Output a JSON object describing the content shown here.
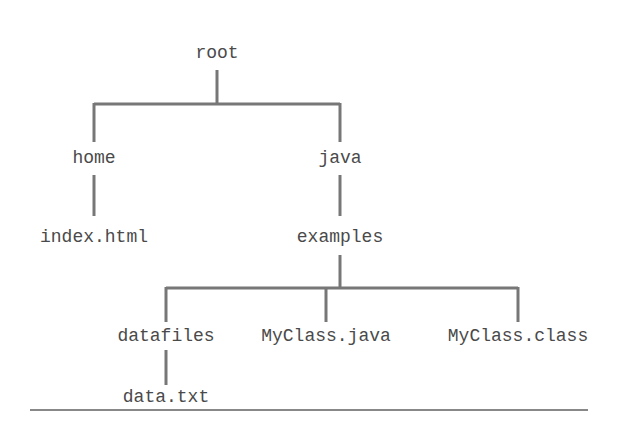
{
  "diagram": {
    "type": "directory-tree",
    "line_color": "#777777",
    "text_color": "#4a4a4a",
    "nodes": {
      "root": {
        "label": "root"
      },
      "home": {
        "label": "home"
      },
      "index_html": {
        "label": "index.html"
      },
      "java": {
        "label": "java"
      },
      "examples": {
        "label": "examples"
      },
      "datafiles": {
        "label": "datafiles"
      },
      "data_txt": {
        "label": "data.txt"
      },
      "myclass_java": {
        "label": "MyClass.java"
      },
      "myclass_class": {
        "label": "MyClass.class"
      }
    },
    "edges": [
      [
        "root",
        "home"
      ],
      [
        "root",
        "java"
      ],
      [
        "home",
        "index_html"
      ],
      [
        "java",
        "examples"
      ],
      [
        "examples",
        "datafiles"
      ],
      [
        "examples",
        "myclass_java"
      ],
      [
        "examples",
        "myclass_class"
      ],
      [
        "datafiles",
        "data_txt"
      ]
    ]
  }
}
